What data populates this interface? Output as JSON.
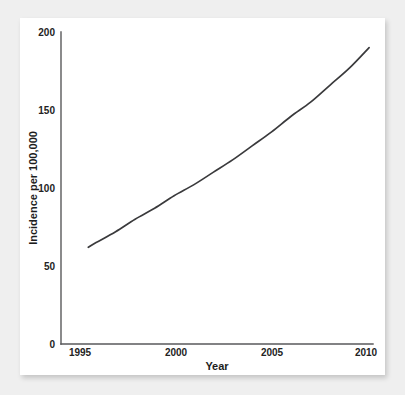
{
  "chart_data": {
    "type": "line",
    "title": "",
    "xlabel": "Year",
    "ylabel": "Incidence per 100,000",
    "xlim": [
      1994.2,
      2010.2
    ],
    "ylim": [
      0,
      200
    ],
    "xticks": [
      1995,
      2000,
      2005,
      2010
    ],
    "xtick_labels": [
      "1995",
      "2000",
      "2005",
      "2010"
    ],
    "yticks": [
      0,
      50,
      100,
      150,
      200
    ],
    "ytick_labels": [
      "0",
      "50",
      "100",
      "150",
      "200"
    ],
    "grid": false,
    "legend": false,
    "series": [
      {
        "name": "Incidence",
        "color": "#3a3a3c",
        "x": [
          1995.6,
          1996,
          1997,
          1998,
          1999,
          2000,
          2001,
          2002,
          2003,
          2004,
          2005,
          2006,
          2007,
          2008,
          2009,
          2010
        ],
        "values": [
          62,
          65,
          72,
          80,
          87,
          95,
          102,
          110,
          118,
          127,
          136,
          146,
          155,
          166,
          177,
          190
        ]
      }
    ]
  },
  "axes": {
    "y_title": "Incidence per 100,000",
    "x_title": "Year",
    "y_labels": [
      "200",
      "150",
      "100",
      "50",
      "0"
    ],
    "x_labels": [
      "1995",
      "2000",
      "2005",
      "2010"
    ]
  },
  "colors": {
    "curve": "#3a3a3c",
    "axis": "#59595b",
    "panel": "#ffffff",
    "background": "#efefef",
    "text": "#232323"
  }
}
